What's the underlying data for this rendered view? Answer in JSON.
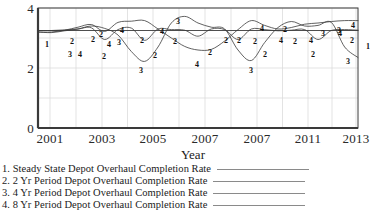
{
  "chart_data": {
    "type": "line",
    "title": "",
    "xlabel": "Year",
    "ylabel": "",
    "xlim": [
      2001,
      2013
    ],
    "ylim": [
      0,
      4
    ],
    "xticks": [
      "2001",
      "2003",
      "2005",
      "2007",
      "2007",
      "2011",
      "2013"
    ],
    "yticks": [
      "0",
      "2",
      "4"
    ],
    "grid": true,
    "legend_position": "below-plot",
    "series": [
      {
        "name": "Steady State Depot Overhaul Completion Rate",
        "number": "1",
        "x": [
          2001,
          2002,
          2003,
          2004,
          2005,
          2006,
          2007,
          2008,
          2009,
          2010,
          2011,
          2012,
          2013
        ],
        "values": [
          3.25,
          3.25,
          3.25,
          3.25,
          3.25,
          3.25,
          3.25,
          3.25,
          3.25,
          3.25,
          3.25,
          3.25,
          3.25
        ]
      },
      {
        "name": "2 Yr Period Depot Overhaul Completion Rate",
        "number": "2",
        "x": [
          2001,
          2001.5,
          2002,
          2002.5,
          2003,
          2003.5,
          2004,
          2004.5,
          2005,
          2005.5,
          2006,
          2006.5,
          2007,
          2007.5,
          2008,
          2008.5,
          2009,
          2009.5,
          2010,
          2010.5,
          2011,
          2011.5,
          2012,
          2012.5,
          2013
        ],
        "values": [
          3.25,
          3.25,
          3.27,
          3.3,
          3.34,
          2.95,
          3.28,
          3.33,
          2.92,
          3.3,
          3.28,
          3.26,
          3.06,
          3.3,
          3.28,
          2.95,
          3.3,
          3.28,
          3.24,
          3.26,
          3.28,
          2.95,
          3.25,
          3.28,
          3.26
        ]
      },
      {
        "name": "4 Yr Period Depot Overhaul Completion Rate",
        "number": "3",
        "x": [
          2001,
          2001.5,
          2002,
          2002.5,
          2003,
          2003.5,
          2004,
          2004.5,
          2005,
          2005.5,
          2006,
          2006.5,
          2007,
          2007.5,
          2008,
          2008.5,
          2009,
          2009.5,
          2010,
          2010.5,
          2011,
          2011.5,
          2012,
          2012.5,
          2013
        ],
        "values": [
          3.2,
          3.18,
          3.24,
          3.3,
          3.4,
          3.32,
          3.1,
          2.55,
          2.22,
          2.7,
          3.5,
          3.72,
          3.5,
          3.36,
          3.3,
          2.6,
          2.25,
          2.85,
          3.35,
          3.55,
          3.4,
          3.42,
          3.52,
          2.7,
          2.35
        ]
      },
      {
        "name": "8 Yr Period Depot Overhaul Completion Rate",
        "number": "4",
        "x": [
          2001,
          2001.5,
          2002,
          2002.5,
          2003,
          2003.5,
          2004,
          2004.5,
          2005,
          2005.5,
          2006,
          2006.5,
          2007,
          2007.5,
          2008,
          2008.5,
          2009,
          2009.5,
          2010,
          2010.5,
          2011,
          2011.5,
          2012,
          2012.5,
          2013
        ],
        "values": [
          3.2,
          3.2,
          3.26,
          3.36,
          3.45,
          3.22,
          3.52,
          3.56,
          3.58,
          3.3,
          3.0,
          2.72,
          2.6,
          2.62,
          2.9,
          3.28,
          3.58,
          3.42,
          3.3,
          3.35,
          3.46,
          3.5,
          3.55,
          3.58,
          3.58
        ]
      }
    ],
    "inline_markers": [
      {
        "series": "1",
        "label": "1",
        "x": 47,
        "y": 45
      },
      {
        "series": "2",
        "label": "2",
        "x": 72,
        "y": 42
      },
      {
        "series": "3",
        "label": "3",
        "x": 70,
        "y": 55
      },
      {
        "series": "4",
        "label": "4",
        "x": 80,
        "y": 55
      },
      {
        "series": "2",
        "label": "2",
        "x": 93,
        "y": 40
      },
      {
        "series": "2",
        "label": "2",
        "x": 101,
        "y": 35
      },
      {
        "series": "2",
        "label": "2",
        "x": 104,
        "y": 57
      },
      {
        "series": "4",
        "label": "4",
        "x": 109,
        "y": 45
      },
      {
        "series": "4",
        "label": "4",
        "x": 122,
        "y": 31
      },
      {
        "series": "3",
        "label": "3",
        "x": 119,
        "y": 43
      },
      {
        "series": "2",
        "label": "2",
        "x": 142,
        "y": 41
      },
      {
        "series": "3",
        "label": "3",
        "x": 141,
        "y": 71
      },
      {
        "series": "2",
        "label": "2",
        "x": 155,
        "y": 56
      },
      {
        "series": "4",
        "label": "4",
        "x": 162,
        "y": 32
      },
      {
        "series": "2",
        "label": "2",
        "x": 175,
        "y": 42
      },
      {
        "series": "3",
        "label": "3",
        "x": 178,
        "y": 22
      },
      {
        "series": "4",
        "label": "4",
        "x": 197,
        "y": 65
      },
      {
        "series": "2",
        "label": "2",
        "x": 210,
        "y": 53
      },
      {
        "series": "2",
        "label": "2",
        "x": 226,
        "y": 41
      },
      {
        "series": "2",
        "label": "2",
        "x": 239,
        "y": 41
      },
      {
        "series": "4",
        "label": "4",
        "x": 262,
        "y": 29
      },
      {
        "series": "2",
        "label": "2",
        "x": 255,
        "y": 42
      },
      {
        "series": "2",
        "label": "2",
        "x": 265,
        "y": 55
      },
      {
        "series": "3",
        "label": "3",
        "x": 251,
        "y": 71
      },
      {
        "series": "4",
        "label": "4",
        "x": 281,
        "y": 41
      },
      {
        "series": "2",
        "label": "2",
        "x": 285,
        "y": 30
      },
      {
        "series": "2",
        "label": "2",
        "x": 295,
        "y": 42
      },
      {
        "series": "4",
        "label": "4",
        "x": 311,
        "y": 41
      },
      {
        "series": "2",
        "label": "2",
        "x": 313,
        "y": 55
      },
      {
        "series": "3",
        "label": "3",
        "x": 323,
        "y": 34
      },
      {
        "series": "4",
        "label": "4",
        "x": 340,
        "y": 34
      },
      {
        "series": "3",
        "label": "3",
        "x": 339,
        "y": 31
      },
      {
        "series": "4",
        "label": "4",
        "x": 353,
        "y": 26
      },
      {
        "series": "2",
        "label": "2",
        "x": 352,
        "y": 41
      },
      {
        "series": "3",
        "label": "3",
        "x": 348,
        "y": 62
      },
      {
        "series": "1",
        "label": "1",
        "x": 368,
        "y": 47
      }
    ]
  },
  "axis": {
    "x_title": "Year",
    "x_tick_positions": [
      50,
      102,
      153,
      205,
      257,
      308,
      356
    ],
    "y_tick_positions": [
      13,
      68,
      124
    ]
  },
  "legend": {
    "entries": [
      {
        "label": "1. Steady State Depot Overhaul Completion Rate"
      },
      {
        "label": "2. 2 Yr Period Depot Overhaul Completion Rate"
      },
      {
        "label": "3. 4 Yr Period Depot Overhaul Completion Rate"
      },
      {
        "label": "4. 8 Yr Period Depot Overhaul Completion Rate"
      }
    ]
  },
  "colors": {
    "line": "#3a3a3a",
    "frame": "#3a3a3a",
    "grid": "#dcdcdc",
    "legend_swatch": "#8a8a8a",
    "text": "#1a1a1a"
  }
}
